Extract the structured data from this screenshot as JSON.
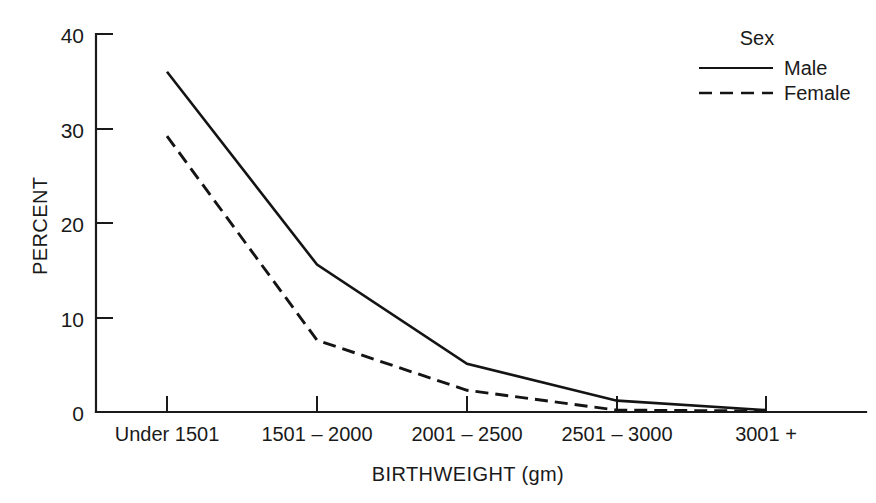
{
  "chart_data": {
    "type": "line",
    "title": "",
    "subtitle": "",
    "xlabel": "BIRTHWEIGHT (gm)",
    "ylabel": "PERCENT",
    "categories": [
      "Under 1501",
      "1501 – 2000",
      "2001 – 2500",
      "2501 – 3000",
      "3001 +"
    ],
    "ylim": [
      0,
      40
    ],
    "yticks": [
      0,
      10,
      20,
      30,
      40
    ],
    "ytick_labels": [
      "0",
      "10",
      "20",
      "30",
      "40"
    ],
    "grid": false,
    "legend_position": "top-right",
    "legend_title": "Sex",
    "series": [
      {
        "name": "Male",
        "style": "solid",
        "color": "#141414",
        "values": [
          36.0,
          15.6,
          5.1,
          1.2,
          0.2
        ]
      },
      {
        "name": "Female",
        "style": "dashed",
        "color": "#141414",
        "values": [
          29.2,
          7.6,
          2.3,
          0.2,
          0.1
        ]
      }
    ]
  },
  "axes": {
    "y_tick_labels": [
      "40",
      "30",
      "20",
      "10",
      "0"
    ],
    "x_tick_labels": [
      "Under 1501",
      "1501 – 2000",
      "2001 – 2500",
      "2501 – 3000",
      "3001 +"
    ],
    "x_axis_title": "BIRTHWEIGHT (gm)",
    "y_axis_title": "PERCENT"
  },
  "legend": {
    "title": "Sex",
    "entries": [
      {
        "label": "Male",
        "style": "solid"
      },
      {
        "label": "Female",
        "style": "dashed"
      }
    ]
  },
  "colors": {
    "ink": "#1a1a1a",
    "series": "#141414",
    "background": "#ffffff"
  }
}
